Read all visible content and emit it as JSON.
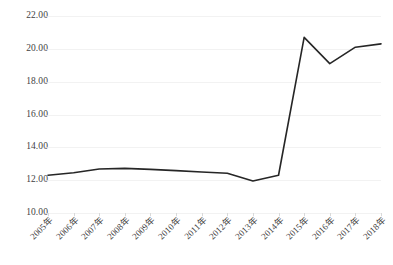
{
  "chart_data": {
    "type": "line",
    "title": "",
    "subtitle": "",
    "xlabel": "",
    "ylabel": "",
    "categories": [
      "2005年",
      "2006年",
      "2007年",
      "2008年",
      "2009年",
      "2010年",
      "2011年",
      "2012年",
      "2013年",
      "2014年",
      "2015年",
      "2016年",
      "2017年",
      "2018年"
    ],
    "series": [
      {
        "name": "series-1",
        "values": [
          12.3,
          12.45,
          12.68,
          12.72,
          12.66,
          12.58,
          12.5,
          12.42,
          11.95,
          12.3,
          20.7,
          19.1,
          20.1,
          20.3
        ]
      }
    ],
    "ylim": [
      10.0,
      22.0
    ],
    "ytick_step": 2.0,
    "ytick_labels": [
      "22.00",
      "20.00",
      "18.00",
      "16.00",
      "14.00",
      "12.00",
      "10.00"
    ],
    "ytick_values": [
      22.0,
      20.0,
      18.0,
      16.0,
      14.0,
      12.0,
      10.0
    ],
    "grid": true,
    "grid_axis": "y",
    "legend": false,
    "legend_position": "none",
    "markers": false,
    "annotations": []
  },
  "style": {
    "line_color": "#262626",
    "grid_color": "#f2f2f2",
    "tick_color": "#d9d9d9",
    "text_color": "#3f3f3f",
    "background": "#ffffff",
    "line_width": 1.6
  }
}
